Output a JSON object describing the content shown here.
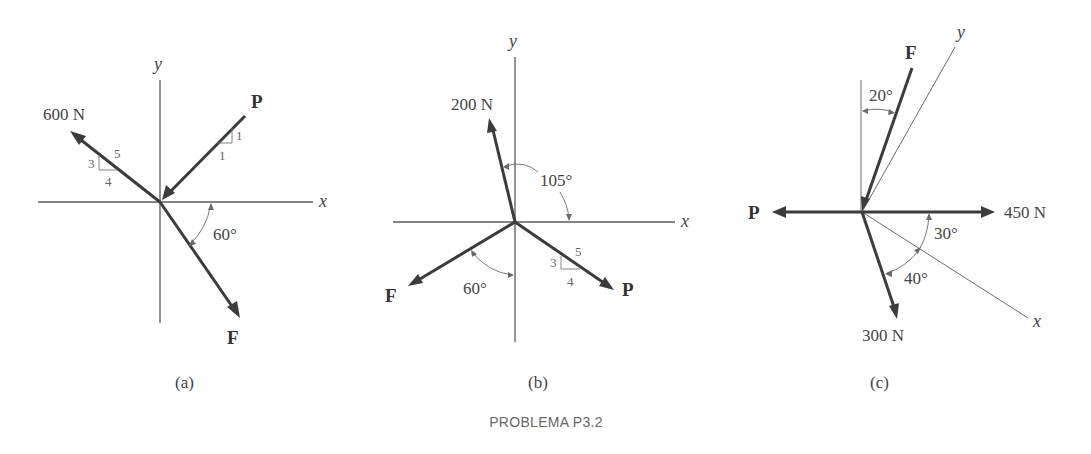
{
  "figure": {
    "title": "PROBLEMA P3.2",
    "panels": [
      {
        "caption": "(a)",
        "axes": {
          "x": "x",
          "y": "y"
        },
        "forces": [
          {
            "label": "600 N",
            "slope": {
              "rise": "3",
              "run": "4",
              "hyp": "5"
            }
          },
          {
            "label": "P",
            "slope": {
              "rise": "1",
              "run": "1"
            }
          },
          {
            "label": "F",
            "angle": "60°"
          }
        ]
      },
      {
        "caption": "(b)",
        "axes": {
          "x": "x",
          "y": "y"
        },
        "forces": [
          {
            "label": "200 N",
            "angle": "105°"
          },
          {
            "label": "F",
            "angle": "60°"
          },
          {
            "label": "P",
            "slope": {
              "rise": "3",
              "run": "4",
              "hyp": "5"
            }
          }
        ]
      },
      {
        "caption": "(c)",
        "axes": {
          "x": "x",
          "y": "y"
        },
        "forces": [
          {
            "label": "F",
            "angle": "20°"
          },
          {
            "label": "P"
          },
          {
            "label": "450 N",
            "angle": "30°"
          },
          {
            "label": "300 N",
            "angle": "40°"
          }
        ]
      }
    ]
  },
  "colors": {
    "background": "#ffffff",
    "force": "#3c3c3c",
    "axis": "#5a5a5a",
    "text": "#444444"
  }
}
